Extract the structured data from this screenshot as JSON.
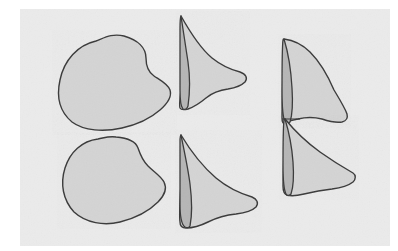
{
  "figure": {
    "panel": {
      "background_color": "#ebebeb",
      "edge_color": "#ffffff",
      "x": 0,
      "y": 0,
      "width": 398,
      "height": 251
    },
    "style": {
      "outline_color": "#3a3a3a",
      "outline_width": 1.4,
      "fill_light": "#d4d4d4",
      "fill_dark": "#b6b6b6",
      "fill_light_label": "light gray fill",
      "fill_dark_label": "dark gray band fill"
    },
    "columns": [
      {
        "id": "column-left",
        "label": "left column",
        "shape_type": "rounded-blob"
      },
      {
        "id": "column-middle",
        "label": "middle column",
        "shape_type": "fin-with-band"
      },
      {
        "id": "column-right",
        "label": "right column",
        "shape_type": "fin-pair-overlapping"
      }
    ],
    "rows": [
      {
        "id": "row-top",
        "label": "top row"
      },
      {
        "id": "row-bottom",
        "label": "bottom row"
      }
    ],
    "shapes": [
      {
        "id": "shape-top-left",
        "name": "rounded blob, top left",
        "column": "left",
        "row": "top",
        "fill": "#d4d4d4",
        "has_inner_band": false,
        "bbox": {
          "x": 57,
          "y": 34,
          "width": 116,
          "height": 97
        },
        "outline_path": "M 96 41 C 78 45 64 60 60 80 C 56 98 60 112 72 122 C 84 131 104 132 122 128 C 140 124 152 117 160 110 C 168 103 172 96 170 90 C 168 84 160 80 154 76 C 148 72 146 66 146 58 C 146 48 138 40 124 36 C 112 33 104 38 96 41 Z"
      },
      {
        "id": "shape-top-middle",
        "name": "fin with dark crescent band, top middle",
        "column": "middle",
        "row": "top",
        "fill": "#d4d4d4",
        "band_fill": "#b6b6b6",
        "has_inner_band": true,
        "bbox": {
          "x": 178,
          "y": 14,
          "width": 70,
          "height": 96
        },
        "outline_path": "M 181 16 C 190 32 200 48 212 58 C 222 66 232 70 240 72 C 246 74 248 78 245 82 C 241 86 234 88 228 89 C 220 90 212 93 206 98 C 200 103 194 107 188 109 C 184 110 181 110 180 108 C 179 104 180 98 181 90 C 183 72 183 50 182 32 C 181 24 181 19 181 16 Z",
        "band_path": "M 181 16 C 183 30 186 48 188 62 C 190 76 190 92 188 106 C 187 109 185 110 183 109 C 181 107 180 100 180 90 C 180 72 180 48 180 30 C 180 22 180 17 181 16 Z"
      },
      {
        "id": "shape-top-right",
        "name": "tall fin with dark crescent band, top right",
        "column": "right",
        "row": "top",
        "fill": "#d4d4d4",
        "band_fill": "#b6b6b6",
        "has_inner_band": true,
        "bbox": {
          "x": 281,
          "y": 36,
          "width": 67,
          "height": 90
        },
        "outline_path": "M 284 39 C 292 40 302 44 310 52 C 320 62 328 76 334 90 C 340 100 345 108 347 114 C 348 118 346 121 342 122 C 336 123 328 121 322 119 C 314 117 306 117 298 119 C 292 120 287 122 285 123 C 283 124 282 122 282 118 C 282 104 283 80 283 60 C 283 48 283 41 284 39 Z",
        "band_path": "M 284 39 C 288 52 291 70 292 88 C 293 104 292 116 290 122 C 288 124 286 124 285 122 C 283 118 282 106 282 90 C 282 68 282 48 283 40 C 283 39 284 39 284 39 Z"
      },
      {
        "id": "shape-bottom-left",
        "name": "rounded blob, bottom left",
        "column": "left",
        "row": "bottom",
        "fill": "#d4d4d4",
        "has_inner_band": false,
        "bbox": {
          "x": 61,
          "y": 137,
          "width": 106,
          "height": 89
        },
        "outline_path": "M 98 139 C 82 141 70 152 65 168 C 60 184 63 200 74 212 C 86 223 104 226 120 222 C 136 218 150 210 158 202 C 165 195 167 188 164 182 C 161 176 154 172 148 166 C 142 160 140 154 138 148 C 136 142 128 138 116 137 C 108 136 104 138 98 139 Z"
      },
      {
        "id": "shape-bottom-middle",
        "name": "fin with dark crescent band, bottom middle",
        "column": "middle",
        "row": "bottom",
        "fill": "#d4d4d4",
        "band_fill": "#b6b6b6",
        "has_inner_band": true,
        "bbox": {
          "x": 178,
          "y": 133,
          "width": 82,
          "height": 96
        },
        "outline_path": "M 181 135 C 190 150 202 166 216 178 C 228 188 242 194 252 197 C 257 199 259 203 256 207 C 252 211 244 213 236 214 C 226 215 216 218 208 222 C 200 226 192 228 186 228 C 182 228 180 226 180 222 C 179 214 180 200 181 184 C 182 166 182 148 181 138 C 181 136 181 135 181 135 Z",
        "band_path": "M 181 135 C 184 150 188 168 190 184 C 192 200 192 216 190 226 C 189 228 187 228 185 227 C 182 225 180 216 180 204 C 180 184 180 158 180 142 C 180 137 180 135 181 135 Z"
      },
      {
        "id": "shape-bottom-right",
        "name": "fin with dark crescent band, bottom right",
        "column": "right",
        "row": "bottom",
        "fill": "#d4d4d4",
        "band_fill": "#b6b6b6",
        "has_inner_band": true,
        "bbox": {
          "x": 282,
          "y": 117,
          "width": 74,
          "height": 80
        },
        "outline_path": "M 285 119 C 294 130 306 142 320 152 C 334 162 346 169 353 173 C 356 175 356 179 353 182 C 348 186 340 188 332 189 C 322 190 312 192 304 194 C 296 196 290 196 287 195 C 284 194 283 191 283 186 C 283 176 284 160 284 144 C 284 130 284 121 285 119 Z",
        "band_path": "M 285 119 C 289 132 292 148 293 162 C 294 176 293 188 291 194 C 289 196 287 196 286 194 C 284 190 283 180 283 166 C 283 148 283 128 284 120 C 284 119 285 119 285 119 Z"
      }
    ],
    "overlap_note": "right-column fins touch along a shared contact line near y=120"
  }
}
